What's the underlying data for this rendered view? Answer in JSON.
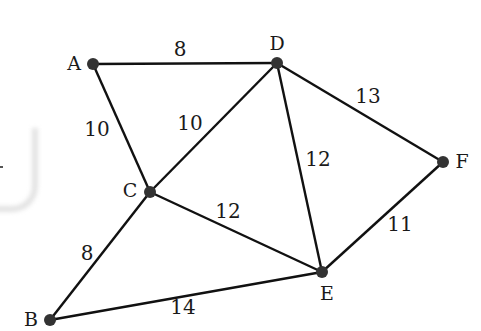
{
  "diagram": {
    "type": "weighted-undirected-graph",
    "nodes": [
      {
        "id": "A",
        "label": "A",
        "x": 93,
        "y": 64,
        "lx": 74,
        "ly": 70
      },
      {
        "id": "D",
        "label": "D",
        "x": 277,
        "y": 63,
        "lx": 277,
        "ly": 50
      },
      {
        "id": "C",
        "label": "C",
        "x": 150,
        "y": 192,
        "lx": 130,
        "ly": 197
      },
      {
        "id": "F",
        "label": "F",
        "x": 443,
        "y": 162,
        "lx": 462,
        "ly": 168
      },
      {
        "id": "E",
        "label": "E",
        "x": 322,
        "y": 272,
        "lx": 327,
        "ly": 300
      },
      {
        "id": "B",
        "label": "B",
        "x": 50,
        "y": 320,
        "lx": 31,
        "ly": 326
      }
    ],
    "edges": [
      {
        "from": "A",
        "to": "D",
        "weight": "8",
        "lx": 180,
        "ly": 56
      },
      {
        "from": "A",
        "to": "C",
        "weight": "10",
        "lx": 97,
        "ly": 136
      },
      {
        "from": "C",
        "to": "D",
        "weight": "10",
        "lx": 190,
        "ly": 130
      },
      {
        "from": "D",
        "to": "F",
        "weight": "13",
        "lx": 368,
        "ly": 103
      },
      {
        "from": "D",
        "to": "E",
        "weight": "12",
        "lx": 318,
        "ly": 166
      },
      {
        "from": "C",
        "to": "E",
        "weight": "12",
        "lx": 228,
        "ly": 218
      },
      {
        "from": "F",
        "to": "E",
        "weight": "11",
        "lx": 400,
        "ly": 231
      },
      {
        "from": "C",
        "to": "B",
        "weight": "8",
        "lx": 87,
        "ly": 260
      },
      {
        "from": "B",
        "to": "E",
        "weight": "14",
        "lx": 183,
        "ly": 314
      }
    ]
  }
}
